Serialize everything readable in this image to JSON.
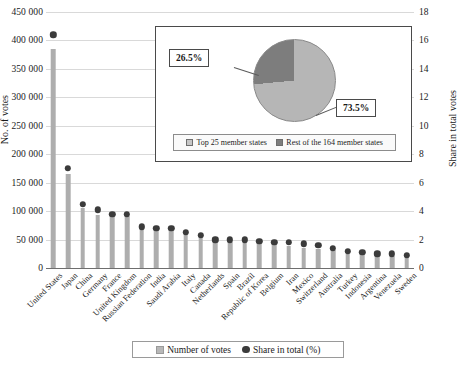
{
  "chart_data": {
    "type": "bar",
    "title": "",
    "subtitle": "",
    "xlabel": "",
    "ylabel": "No. of votes",
    "y2label": "Share in total votes",
    "ylim": [
      0,
      450000
    ],
    "y2lim": [
      0,
      18
    ],
    "grid": true,
    "legend_position": "bottom",
    "categories": [
      "United States",
      "Japan",
      "China",
      "Germany",
      "France",
      "United Kingdom",
      "Russian Federation",
      "India",
      "Saudi Arabia",
      "Italy",
      "Canada",
      "Netherlands",
      "Spain",
      "Brazil",
      "Republic of Korea",
      "Belgium",
      "Iran",
      "Mexico",
      "Switzerland",
      "Australia",
      "Turkey",
      "Indonesia",
      "Argentina",
      "Venezuela",
      "Sweden"
    ],
    "ytick_labels": [
      "0",
      "50 000",
      "100 000",
      "150 000",
      "200 000",
      "250 000",
      "300 000",
      "350 000",
      "400 000",
      "450 000"
    ],
    "ytick_values": [
      0,
      50000,
      100000,
      150000,
      200000,
      250000,
      300000,
      350000,
      400000,
      450000
    ],
    "y2tick_labels": [
      "0",
      "2",
      "4",
      "6",
      "8",
      "10",
      "12",
      "14",
      "16",
      "18"
    ],
    "y2tick_values": [
      0,
      2,
      4,
      6,
      8,
      10,
      12,
      14,
      16,
      18
    ],
    "series": [
      {
        "name": "Number of votes",
        "type": "bar",
        "axis": "left",
        "color": "#aeaeae",
        "values": [
          385000,
          165000,
          105000,
          94000,
          93000,
          92000,
          70000,
          67000,
          67000,
          60000,
          56000,
          45000,
          45000,
          45000,
          44000,
          42000,
          38000,
          36000,
          33000,
          31000,
          25000,
          24000,
          22000,
          22000,
          21000
        ]
      },
      {
        "name": "Share in total (%)",
        "type": "scatter",
        "axis": "right",
        "color": "#3b3b3b",
        "values": [
          16.4,
          7.0,
          4.5,
          4.1,
          3.8,
          3.8,
          2.9,
          2.8,
          2.8,
          2.5,
          2.3,
          2.0,
          2.0,
          2.0,
          1.9,
          1.8,
          1.8,
          1.7,
          1.6,
          1.4,
          1.2,
          1.1,
          1.0,
          1.0,
          0.9
        ]
      }
    ],
    "legend": [
      {
        "label": "Number of votes",
        "marker": "square",
        "color": "#b8b8b8"
      },
      {
        "label": "Share in total (%)",
        "marker": "circle",
        "color": "#3b3b3b"
      }
    ],
    "inset": {
      "type": "pie",
      "labels": [
        "Top 25 member states",
        "Rest of the 164 member states"
      ],
      "values": [
        73.5,
        26.5
      ],
      "value_labels": [
        "73.5%",
        "26.5%"
      ],
      "colors": [
        "#b6b6b6",
        "#7d7d7d"
      ]
    }
  }
}
